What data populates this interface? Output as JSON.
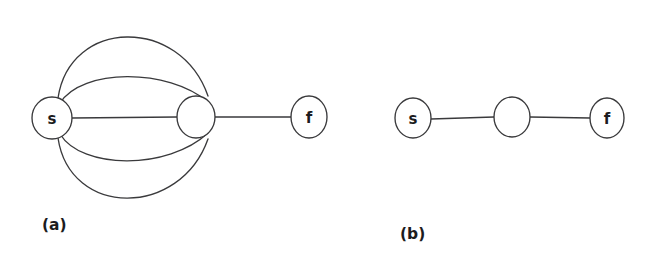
{
  "figure": {
    "background_color": "#ffffff",
    "stroke_color": "#3a3a3c",
    "label_color": "#1c1c1e",
    "width": 654,
    "height": 258
  },
  "panels": [
    {
      "id": "panel-a",
      "caption": "(a)",
      "caption_x": 42,
      "caption_y": 230,
      "description": "multigraph with five parallel edges between s and the unlabeled middle vertex, plus one edge to f",
      "nodes": [
        {
          "id": "s",
          "label": "s",
          "cx": 52,
          "cy": 118,
          "rx": 20,
          "ry": 21
        },
        {
          "id": "mid",
          "label": "",
          "cx": 196,
          "cy": 117,
          "rx": 19,
          "ry": 21
        },
        {
          "id": "f",
          "label": "f",
          "cx": 309,
          "cy": 117,
          "rx": 18,
          "ry": 21
        }
      ],
      "edges": [
        {
          "id": "a-edge-outer-top",
          "from": "s",
          "to": "mid",
          "kind": "arc",
          "bow": -106,
          "path": "M 58 98 C 70 18, 180 16, 208 96"
        },
        {
          "id": "a-edge-inner-top",
          "from": "s",
          "to": "mid",
          "kind": "arc",
          "bow": -45,
          "path": "M 60 103 C 82 68, 168 68, 208 102"
        },
        {
          "id": "a-edge-straight",
          "from": "s",
          "to": "mid",
          "kind": "straight",
          "bow": 0,
          "path": "M 72 118 L 177 117"
        },
        {
          "id": "a-edge-inner-bottom",
          "from": "s",
          "to": "mid",
          "kind": "arc",
          "bow": 49,
          "path": "M 60 134 C 82 170, 168 170, 208 133"
        },
        {
          "id": "a-edge-outer-bottom",
          "from": "s",
          "to": "mid",
          "kind": "arc",
          "bow": 96,
          "path": "M 58 138 C 70 218, 180 218, 208 139"
        },
        {
          "id": "a-edge-mid-f",
          "from": "mid",
          "to": "f",
          "kind": "straight",
          "bow": 0,
          "path": "M 215 117 L 291 117"
        }
      ]
    },
    {
      "id": "panel-b",
      "caption": "(b)",
      "caption_x": 400,
      "caption_y": 239,
      "description": "simple path graph s — middle vertex — f",
      "nodes": [
        {
          "id": "s",
          "label": "s",
          "cx": 413,
          "cy": 118,
          "rx": 18,
          "ry": 20
        },
        {
          "id": "mid",
          "label": "",
          "cx": 512,
          "cy": 117,
          "rx": 18,
          "ry": 20
        },
        {
          "id": "f",
          "label": "f",
          "cx": 607,
          "cy": 118,
          "rx": 17,
          "ry": 20
        }
      ],
      "edges": [
        {
          "id": "b-edge-s-mid",
          "from": "s",
          "to": "mid",
          "kind": "straight",
          "bow": 0,
          "path": "M 431 119 L 494 117"
        },
        {
          "id": "b-edge-mid-f",
          "from": "mid",
          "to": "f",
          "kind": "straight",
          "bow": 0,
          "path": "M 530 117 L 590 118"
        }
      ]
    }
  ]
}
